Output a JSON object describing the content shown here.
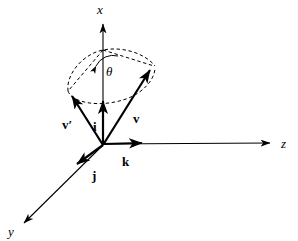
{
  "figure": {
    "background_color": "#ffffff",
    "stroke_color": "#000000",
    "axes": [
      {
        "id": "x",
        "label": "x",
        "style": "italic",
        "direction": "up",
        "tip": [
          103,
          17
        ],
        "origin": [
          103,
          145
        ]
      },
      {
        "id": "y",
        "label": "y",
        "style": "italic",
        "direction": "down-left",
        "tip": [
          18,
          228
        ],
        "origin": [
          103,
          145
        ]
      },
      {
        "id": "z",
        "label": "z",
        "style": "italic",
        "direction": "right",
        "tip": [
          277,
          143
        ],
        "origin": [
          103,
          145
        ]
      }
    ],
    "basis_vectors": [
      {
        "id": "i",
        "label": "i",
        "style": "bold",
        "tip": [
          103,
          95
        ],
        "label_pos": [
          96,
          127
        ]
      },
      {
        "id": "j",
        "label": "j",
        "style": "bold",
        "tip": [
          72,
          169
        ],
        "label_pos": [
          95,
          175
        ]
      },
      {
        "id": "k",
        "label": "k",
        "style": "bold",
        "tip": [
          148,
          143
        ],
        "label_pos": [
          126,
          162
        ]
      }
    ],
    "vectors": [
      {
        "id": "v",
        "label": "v",
        "style": "bold",
        "tip": [
          155,
          65
        ],
        "label_pos": [
          136,
          119
        ]
      },
      {
        "id": "v-prime",
        "label": "v′",
        "style": "bold",
        "tip": [
          68,
          91
        ],
        "label_pos": [
          69,
          125
        ]
      }
    ],
    "angle": {
      "id": "theta",
      "label": "θ",
      "style": "italic",
      "label_pos": [
        110,
        71
      ],
      "description": "angle between x-axis and vector v"
    },
    "cone": {
      "apex": [
        103,
        50
      ],
      "dashed": true,
      "description": "dashed cone of revolution about the x-axis connecting v and v-prime"
    },
    "origin": [
      103,
      145
    ]
  }
}
